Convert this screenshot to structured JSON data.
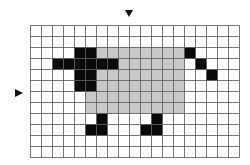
{
  "figure": {
    "grid": {
      "columns": 19,
      "rows": 12,
      "cell_size_px": 11,
      "origin_px": [
        30,
        25
      ],
      "line_color": "#555555",
      "background": "#ffffff"
    },
    "axis_markers": [
      {
        "name": "vertical-axis-marker",
        "position": "top",
        "at_column_boundary": 9
      },
      {
        "name": "horizontal-axis-marker",
        "position": "left",
        "at_row_boundary": 6
      }
    ],
    "colors": {
      "body": "#c8c8c8",
      "black": "#0a0a0a"
    },
    "shapes": [
      {
        "name": "body",
        "color": "body",
        "cells": [
          [
            6,
            2
          ],
          [
            7,
            2
          ],
          [
            8,
            2
          ],
          [
            9,
            2
          ],
          [
            10,
            2
          ],
          [
            11,
            2
          ],
          [
            12,
            2
          ],
          [
            13,
            2
          ],
          [
            8,
            3
          ],
          [
            9,
            3
          ],
          [
            10,
            3
          ],
          [
            11,
            3
          ],
          [
            12,
            3
          ],
          [
            13,
            3
          ],
          [
            6,
            4
          ],
          [
            7,
            4
          ],
          [
            8,
            4
          ],
          [
            9,
            4
          ],
          [
            10,
            4
          ],
          [
            11,
            4
          ],
          [
            12,
            4
          ],
          [
            13,
            4
          ],
          [
            6,
            5
          ],
          [
            7,
            5
          ],
          [
            8,
            5
          ],
          [
            9,
            5
          ],
          [
            10,
            5
          ],
          [
            11,
            5
          ],
          [
            12,
            5
          ],
          [
            13,
            5
          ],
          [
            5,
            6
          ],
          [
            6,
            6
          ],
          [
            7,
            6
          ],
          [
            8,
            6
          ],
          [
            9,
            6
          ],
          [
            10,
            6
          ],
          [
            11,
            6
          ],
          [
            12,
            6
          ],
          [
            13,
            6
          ],
          [
            5,
            7
          ],
          [
            6,
            7
          ],
          [
            7,
            7
          ],
          [
            8,
            7
          ],
          [
            9,
            7
          ],
          [
            10,
            7
          ],
          [
            11,
            7
          ],
          [
            12,
            7
          ],
          [
            13,
            7
          ]
        ]
      },
      {
        "name": "head",
        "color": "black",
        "cells": [
          [
            4,
            2
          ],
          [
            5,
            2
          ],
          [
            4,
            3
          ],
          [
            5,
            3
          ],
          [
            4,
            4
          ],
          [
            5,
            4
          ],
          [
            4,
            5
          ],
          [
            5,
            5
          ]
        ]
      },
      {
        "name": "ears",
        "color": "black",
        "cells": [
          [
            2,
            3
          ],
          [
            3,
            3
          ],
          [
            6,
            3
          ],
          [
            7,
            3
          ]
        ]
      },
      {
        "name": "front-leg",
        "color": "black",
        "cells": [
          [
            6,
            8
          ],
          [
            6,
            9
          ],
          [
            5,
            9
          ]
        ]
      },
      {
        "name": "back-leg",
        "color": "black",
        "cells": [
          [
            11,
            8
          ],
          [
            11,
            9
          ],
          [
            10,
            9
          ]
        ]
      },
      {
        "name": "tail",
        "color": "black",
        "cells": [
          [
            14,
            2
          ],
          [
            15,
            3
          ],
          [
            16,
            4
          ]
        ]
      }
    ]
  }
}
